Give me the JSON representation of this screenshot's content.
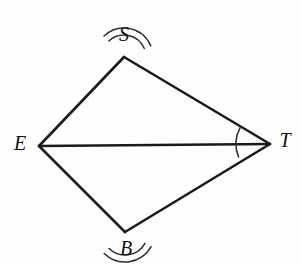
{
  "figure": {
    "kind": "geometry-diagram",
    "shape_name": "quadrilateral SETB with diagonal ET",
    "background_color": "#fefefe",
    "stroke_color": "#1a1a1a",
    "label_color": "#111111",
    "arc_color": "#2b2b2b",
    "width": 302,
    "height": 266
  },
  "vertices": {
    "S": {
      "label": "S",
      "x": 124,
      "y": 57,
      "label_x": 124,
      "label_y": 36
    },
    "E": {
      "label": "E",
      "x": 39,
      "y": 146,
      "label_x": 20,
      "label_y": 145
    },
    "T": {
      "label": "T",
      "x": 270,
      "y": 144,
      "label_x": 285,
      "label_y": 142
    },
    "B": {
      "label": "B",
      "x": 125,
      "y": 232,
      "label_x": 126,
      "label_y": 250
    }
  },
  "edges": [
    {
      "name": "edge-SE",
      "from": "S",
      "to": "E"
    },
    {
      "name": "edge-ST",
      "from": "S",
      "to": "T"
    },
    {
      "name": "edge-EB",
      "from": "E",
      "to": "B"
    },
    {
      "name": "edge-BT",
      "from": "B",
      "to": "T"
    }
  ],
  "diagonals": [
    {
      "name": "diagonal-ET",
      "from": "E",
      "to": "T"
    }
  ],
  "angle_marks": [
    {
      "name": "angle-mark-S",
      "vertex": "S",
      "tick_count": 2,
      "radii": [
        22,
        29
      ],
      "start_angle_deg": 133.6,
      "end_angle_deg": 22.5
    },
    {
      "name": "angle-mark-B",
      "vertex": "B",
      "tick_count": 2,
      "radii": [
        23,
        30
      ],
      "start_angle_deg": 226.0,
      "end_angle_deg": 330.6
    },
    {
      "name": "angle-mark-T",
      "vertex": "T",
      "tick_count": 1,
      "radii": [
        34
      ],
      "start_angle_deg": 202.4,
      "end_angle_deg": 151.4
    }
  ]
}
